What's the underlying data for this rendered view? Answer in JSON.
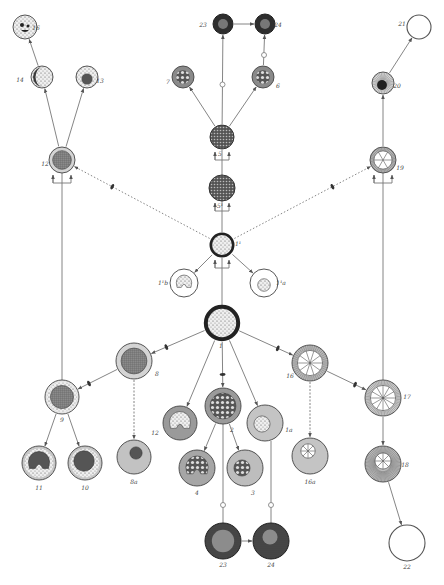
{
  "diagram": {
    "colors": {
      "line": "#777777",
      "ink": "#333333",
      "fill_gray": "#a8a8a8",
      "fill_light": "#d8d8d8",
      "fill_dark": "#4a4a4a",
      "paper": "#ffffff"
    },
    "nodes": [
      {
        "id": "16",
        "label": "16",
        "x": 25,
        "y": 27,
        "r": 12,
        "style": "dotted-nucleus-dark",
        "lx": 36,
        "ly": 30
      },
      {
        "id": "14",
        "label": "14",
        "x": 42,
        "y": 77,
        "r": 11,
        "style": "crescent-dark",
        "lx": 20,
        "ly": 82
      },
      {
        "id": "13",
        "label": "13",
        "x": 87,
        "y": 77,
        "r": 11,
        "style": "dotted-dark-core",
        "lx": 100,
        "ly": 83
      },
      {
        "id": "12",
        "label": "12",
        "x": 62,
        "y": 160,
        "r": 13,
        "style": "ring-grid",
        "lx": 45,
        "ly": 166
      },
      {
        "id": "23t",
        "label": "23",
        "x": 223,
        "y": 24,
        "r": 10,
        "style": "dark-core",
        "lx": 203,
        "ly": 27
      },
      {
        "id": "24t",
        "label": "24",
        "x": 265,
        "y": 24,
        "r": 10,
        "style": "dark-core",
        "lx": 278,
        "ly": 27
      },
      {
        "id": "7",
        "label": "7",
        "x": 183,
        "y": 77,
        "r": 11,
        "style": "gray-dotted",
        "lx": 168,
        "ly": 84
      },
      {
        "id": "6",
        "label": "6",
        "x": 263,
        "y": 77,
        "r": 11,
        "style": "gray-dotted",
        "lx": 278,
        "ly": 88
      },
      {
        "id": "5",
        "label": "5",
        "x": 222,
        "y": 137,
        "r": 12,
        "style": "dark-dotted",
        "lx": 220,
        "ly": 156
      },
      {
        "id": "5a",
        "label": "5¹",
        "x": 222,
        "y": 188,
        "r": 13,
        "style": "dark-dotted",
        "lx": 220,
        "ly": 208
      },
      {
        "id": "1a",
        "label": "1¹",
        "x": 222,
        "y": 245,
        "r": 13,
        "style": "thick-ring-dotted",
        "lx": 238,
        "ly": 246
      },
      {
        "id": "1b",
        "label": "1¹b",
        "x": 184,
        "y": 283,
        "r": 14,
        "style": "ring-horseshoe",
        "lx": 163,
        "ly": 285
      },
      {
        "id": "1c",
        "label": "1¹a",
        "x": 264,
        "y": 283,
        "r": 14,
        "style": "ring-small-core",
        "lx": 281,
        "ly": 285
      },
      {
        "id": "1",
        "label": "1",
        "x": 222,
        "y": 323,
        "r": 18,
        "style": "thick-ring-dotted",
        "lx": 221,
        "ly": 348
      },
      {
        "id": "19",
        "label": "19",
        "x": 383,
        "y": 160,
        "r": 13,
        "style": "wheel",
        "lx": 400,
        "ly": 170
      },
      {
        "id": "20",
        "label": "20",
        "x": 383,
        "y": 83,
        "r": 11,
        "style": "radial-dark-core",
        "lx": 397,
        "ly": 88
      },
      {
        "id": "21",
        "label": "21",
        "x": 419,
        "y": 27,
        "r": 12,
        "style": "empty",
        "lx": 402,
        "ly": 26
      },
      {
        "id": "8",
        "label": "8",
        "x": 134,
        "y": 361,
        "r": 18,
        "style": "ring-grid",
        "lx": 157,
        "ly": 376
      },
      {
        "id": "9",
        "label": "9",
        "x": 62,
        "y": 397,
        "r": 17,
        "style": "ring-dotted-grid",
        "lx": 62,
        "ly": 422
      },
      {
        "id": "11",
        "label": "11",
        "x": 39,
        "y": 463,
        "r": 17,
        "style": "horseshoe-dark",
        "lx": 39,
        "ly": 490
      },
      {
        "id": "10",
        "label": "10",
        "x": 85,
        "y": 463,
        "r": 17,
        "style": "dark-dotted-core",
        "lx": 85,
        "ly": 490
      },
      {
        "id": "8a",
        "label": "8a",
        "x": 134,
        "y": 457,
        "r": 17,
        "style": "gray-small-dark",
        "lx": 134,
        "ly": 484
      },
      {
        "id": "12b",
        "label": "12",
        "x": 180,
        "y": 423,
        "r": 17,
        "style": "gray-horseshoe-light",
        "lx": 155,
        "ly": 435
      },
      {
        "id": "2",
        "label": "2",
        "x": 223,
        "y": 406,
        "r": 18,
        "style": "gray-grid-cells",
        "lx": 232,
        "ly": 432
      },
      {
        "id": "4",
        "label": "4",
        "x": 197,
        "y": 468,
        "r": 18,
        "style": "gray-horseshoe-cells",
        "lx": 197,
        "ly": 495
      },
      {
        "id": "3",
        "label": "3",
        "x": 245,
        "y": 468,
        "r": 18,
        "style": "gray-small-cells",
        "lx": 253,
        "ly": 495
      },
      {
        "id": "1a2",
        "label": "1a",
        "x": 265,
        "y": 423,
        "r": 18,
        "style": "gray-light-core",
        "lx": 289,
        "ly": 432
      },
      {
        "id": "16n",
        "label": "16",
        "x": 310,
        "y": 363,
        "r": 18,
        "style": "wheel",
        "lx": 290,
        "ly": 378
      },
      {
        "id": "16a",
        "label": "16a",
        "x": 310,
        "y": 456,
        "r": 18,
        "style": "gray-wheel-small",
        "lx": 310,
        "ly": 484
      },
      {
        "id": "17",
        "label": "17",
        "x": 383,
        "y": 398,
        "r": 18,
        "style": "wheel-radial",
        "lx": 407,
        "ly": 399
      },
      {
        "id": "18",
        "label": "18",
        "x": 383,
        "y": 464,
        "r": 18,
        "style": "radial-light-core",
        "lx": 405,
        "ly": 467
      },
      {
        "id": "23",
        "label": "23",
        "x": 223,
        "y": 541,
        "r": 18,
        "style": "dark-gray-core",
        "lx": 223,
        "ly": 567
      },
      {
        "id": "24",
        "label": "24",
        "x": 271,
        "y": 541,
        "r": 18,
        "style": "dark-gray-small",
        "lx": 271,
        "ly": 567
      },
      {
        "id": "22",
        "label": "22",
        "x": 407,
        "y": 543,
        "r": 18,
        "style": "empty",
        "lx": 407,
        "ly": 569
      }
    ],
    "edges": [
      {
        "from": "14",
        "to": "16",
        "type": "arrow"
      },
      {
        "from": "12",
        "to": "14",
        "type": "arrow"
      },
      {
        "from": "12",
        "to": "13",
        "type": "arrow"
      },
      {
        "from": "5",
        "to": "7",
        "type": "arrow"
      },
      {
        "from": "5",
        "to": "6",
        "type": "arrow"
      },
      {
        "from": "5",
        "to": "23t",
        "type": "circle-arrow"
      },
      {
        "from": "6",
        "to": "24t",
        "type": "circle-arrow"
      },
      {
        "from": "23t",
        "to": "24t",
        "type": "arrow"
      },
      {
        "from": "1a",
        "to": "1b",
        "type": "arrow"
      },
      {
        "from": "1a",
        "to": "1c",
        "type": "arrow"
      },
      {
        "from": "1a",
        "to": "12",
        "type": "dotted-arrow"
      },
      {
        "from": "1a",
        "to": "19",
        "type": "dotted-arrow"
      },
      {
        "from": "20",
        "to": "21",
        "type": "arrow"
      },
      {
        "from": "19",
        "to": "20",
        "type": "arrow"
      },
      {
        "from": "1",
        "to": "8",
        "type": "arrow-bar"
      },
      {
        "from": "1",
        "to": "12b",
        "type": "arrow"
      },
      {
        "from": "1",
        "to": "2",
        "type": "arrow-bar"
      },
      {
        "from": "1",
        "to": "1a2",
        "type": "arrow"
      },
      {
        "from": "1",
        "to": "16n",
        "type": "arrow-bar"
      },
      {
        "from": "8",
        "to": "9",
        "type": "arrow-bar"
      },
      {
        "from": "8",
        "to": "8a",
        "type": "dashed-arrow"
      },
      {
        "from": "9",
        "to": "11",
        "type": "arrow"
      },
      {
        "from": "9",
        "to": "10",
        "type": "arrow"
      },
      {
        "from": "2",
        "to": "4",
        "type": "arrow"
      },
      {
        "from": "2",
        "to": "3",
        "type": "arrow"
      },
      {
        "from": "16n",
        "to": "17",
        "type": "arrow-bar"
      },
      {
        "from": "16n",
        "to": "16a",
        "type": "dashed-arrow"
      },
      {
        "from": "17",
        "to": "18",
        "type": "arrow"
      },
      {
        "from": "18",
        "to": "22",
        "type": "arrow"
      },
      {
        "from": "23",
        "to": "24",
        "type": "arrow"
      }
    ],
    "verticals": [
      {
        "x": 62,
        "y1": 173,
        "y2": 380,
        "desc": "line from 9 up to 12 bracket"
      },
      {
        "x": 383,
        "y1": 173,
        "y2": 380,
        "desc": "line from 17 up to 19 bracket"
      },
      {
        "x": 222,
        "y1": 150,
        "y2": 175,
        "desc": "5 to 5¹"
      },
      {
        "x": 222,
        "y1": 201,
        "y2": 232,
        "desc": "5¹ to 1¹"
      },
      {
        "x": 222,
        "y1": 258,
        "y2": 305,
        "desc": "1¹ to 1"
      },
      {
        "x": 223,
        "y1": 424,
        "y2": 523,
        "desc": "2 to 23"
      },
      {
        "x": 271,
        "y1": 441,
        "y2": 523,
        "desc": "1a to 24"
      }
    ]
  }
}
